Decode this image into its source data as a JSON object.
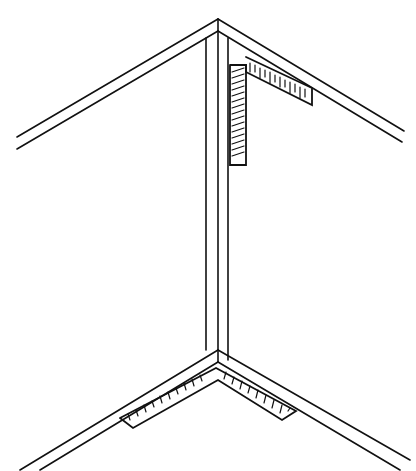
{
  "diagram": {
    "stroke_color": "#111111",
    "background": "#ffffff",
    "parts": [
      "top-corner-molding",
      "top-framing-square",
      "vertical-corner-trim",
      "bottom-corner-molding",
      "bottom-framing-square"
    ]
  }
}
